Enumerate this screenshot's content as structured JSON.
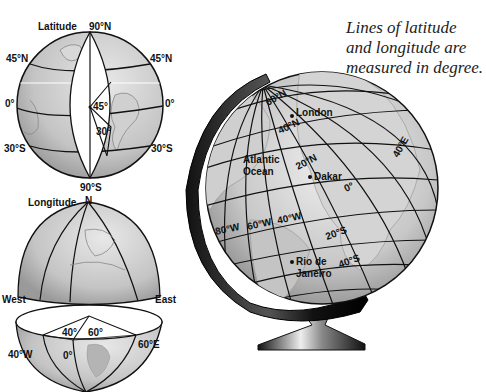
{
  "caption": {
    "lines": [
      "Lines of latitude",
      "and longitude are",
      "measured in degree."
    ]
  },
  "latitude_globe": {
    "title": "Latitude",
    "north_pole": "90°N",
    "south_pole": "90°S",
    "left_labels": [
      "45°N",
      "0°",
      "30°S"
    ],
    "right_labels": [
      "45°N",
      "0°",
      "30°S"
    ],
    "angles": [
      "45°",
      "30°"
    ]
  },
  "longitude_globe": {
    "title": "Longitude",
    "north": "N",
    "west": "West",
    "east": "East",
    "angles": [
      "40°",
      "60°"
    ],
    "meridian_labels": [
      "40°W",
      "0°",
      "60°E"
    ]
  },
  "big_globe": {
    "latitudes": [
      "60°N",
      "40°N",
      "20°N",
      "0°",
      "20°S",
      "40°S"
    ],
    "longitudes": [
      "80°W",
      "60°W",
      "40°W",
      "40°E"
    ],
    "places": [
      "London",
      "Dakar",
      "Rio de",
      "Janeiro"
    ],
    "ocean": [
      "Atlantic",
      "Ocean"
    ]
  },
  "colors": {
    "ink": "#111111",
    "land": "#c8c8c8",
    "sea": "#dcdcdc",
    "stand": "#1a1a1a"
  }
}
